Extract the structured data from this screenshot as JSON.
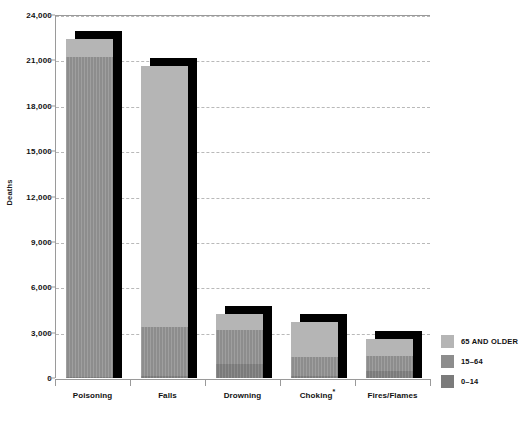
{
  "chart_data": {
    "type": "bar",
    "subtype": "stacked-bar",
    "title": "",
    "subtitle": "",
    "xlabel": "",
    "ylabel": "Deaths",
    "ylim": [
      0,
      24000
    ],
    "ytick_values": [
      0,
      3000,
      6000,
      9000,
      12000,
      15000,
      18000,
      21000,
      24000
    ],
    "ytick_labels": [
      "0",
      "3,000",
      "6,000",
      "9,000",
      "12,000",
      "15,000",
      "18,000",
      "21,000",
      "24,000"
    ],
    "grid": true,
    "grid_style": "dashed-horizontal",
    "legend_position": "right",
    "categories": [
      "Poisoning",
      "Falls",
      "Drowning",
      "Choking*",
      "Fires/Flames"
    ],
    "series": [
      {
        "name": "0–14",
        "color": "#7b7b7b",
        "values": [
          60,
          130,
          900,
          150,
          450
        ]
      },
      {
        "name": "15–64",
        "color": "#8d8d8d",
        "values": [
          21140,
          3270,
          2250,
          1250,
          1000
        ]
      },
      {
        "name": "65 AND OLDER",
        "color": "#b5b5b5",
        "values": [
          1200,
          17200,
          1050,
          2300,
          1100
        ]
      }
    ],
    "totals": [
      22400,
      20600,
      4200,
      3700,
      2550
    ],
    "annotations": [
      "* Choking category marked with asterisk footnote"
    ]
  },
  "axis": {
    "y_title": "Deaths"
  },
  "legend": {
    "items": [
      {
        "label": "65 AND OLDER",
        "color": "#b5b5b5"
      },
      {
        "label": "15–64",
        "color": "#8d8d8d"
      },
      {
        "label": "0–14",
        "color": "#7b7b7b"
      }
    ]
  }
}
